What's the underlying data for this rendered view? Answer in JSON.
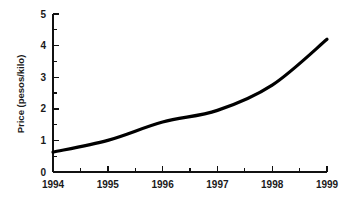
{
  "chart_data": {
    "type": "line",
    "title": "",
    "xlabel": "",
    "ylabel": "Price (pesos/kilo)",
    "categories": [
      "1994",
      "1995",
      "1996",
      "1997",
      "1998",
      "1999"
    ],
    "x": [
      1994,
      1995,
      1996,
      1997,
      1998,
      1999
    ],
    "values": [
      0.63,
      1.0,
      1.58,
      1.95,
      2.75,
      4.2
    ],
    "series": [
      {
        "name": "Price",
        "values": [
          0.63,
          1.0,
          1.58,
          1.95,
          2.75,
          4.2
        ]
      }
    ],
    "xlim": [
      1994,
      1999
    ],
    "ylim": [
      0,
      5
    ],
    "y_ticks": [
      "0",
      "1",
      "2",
      "3",
      "4",
      "5"
    ],
    "y_minor_ticks": [
      0.5,
      1.5,
      2.5,
      3.5,
      4.5
    ],
    "x_ticks": [
      "1994",
      "1995",
      "1996",
      "1997",
      "1998",
      "1999"
    ],
    "x_minor_ticks": [
      1994.5,
      1995.5,
      1996.5,
      1997.5,
      1998.5
    ],
    "grid": false,
    "legend": "none",
    "line_color": "#000000",
    "background_color": "#ffffff",
    "axis_color": "#111111"
  },
  "axes": {
    "y_title": "Price (pesos/kilo)",
    "y_tick_labels": [
      "5",
      "4",
      "3",
      "2",
      "1",
      "0"
    ],
    "x_tick_labels": [
      "1994",
      "1995",
      "1996",
      "1997",
      "1998",
      "1999"
    ]
  }
}
